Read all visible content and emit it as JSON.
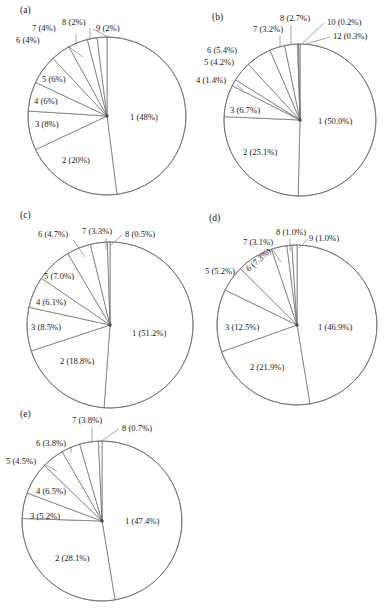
{
  "figure": {
    "width": 384,
    "height": 612,
    "background": "#ffffff",
    "stroke_color": "#6b6b6b",
    "text_color": "#1a1a1a"
  },
  "chart_data": [
    {
      "type": "pie",
      "id": "panel-a",
      "title": "(a)",
      "center": [
        107,
        116
      ],
      "radius": 79,
      "start_angle": -90,
      "direction": "clockwise",
      "grid": false,
      "legend": "none",
      "labels": [
        "1 (48%)",
        "2 (20%)",
        "3 (8%)",
        "4 (6%)",
        "5 (6%)",
        "6 (4%)",
        "7 (4%)",
        "8 (2%)",
        "9 (2%)"
      ],
      "categories": [
        "1",
        "2",
        "3",
        "4",
        "5",
        "6",
        "7",
        "8",
        "9"
      ],
      "values": [
        48,
        20,
        8,
        6,
        6,
        4,
        4,
        2,
        2
      ],
      "label_positions": [
        {
          "label": "1 (48%)",
          "x": 130,
          "y": 120,
          "anchor": "start",
          "leader": null,
          "rotate": 0
        },
        {
          "label": "2 (20%)",
          "x": 62,
          "y": 163,
          "anchor": "start",
          "leader": null,
          "rotate": 0
        },
        {
          "label": "3 (8%)",
          "x": 35,
          "y": 127,
          "anchor": "start",
          "leader": null,
          "rotate": 0
        },
        {
          "label": "4 (6%)",
          "x": 34,
          "y": 104,
          "anchor": "start",
          "leader": null,
          "rotate": 0
        },
        {
          "label": "5 (6%)",
          "x": 42,
          "y": 82,
          "anchor": "start",
          "leader": null,
          "rotate": 0
        },
        {
          "label": "6 (4%)",
          "x": 16,
          "y": 43,
          "anchor": "start",
          "leader": [
            [
              68,
              46
            ],
            [
              83,
              57
            ]
          ],
          "rotate": 0
        },
        {
          "label": "7 (4%)",
          "x": 32,
          "y": 31,
          "anchor": "start",
          "leader": [
            [
              76,
              34
            ],
            [
              76,
              44
            ]
          ],
          "rotate": 0
        },
        {
          "label": "8 (2%)",
          "x": 62,
          "y": 25,
          "anchor": "start",
          "leader": [
            [
              90,
              28
            ],
            [
              90,
              40
            ]
          ],
          "rotate": 0
        },
        {
          "label": "9 (2%)",
          "x": 96,
          "y": 31,
          "anchor": "start",
          "leader": [
            [
              93,
              29
            ],
            [
              110,
              38
            ]
          ],
          "rotate": 0
        }
      ]
    },
    {
      "type": "pie",
      "id": "panel-b",
      "title": "(b)",
      "center": [
        300,
        120
      ],
      "radius": 76,
      "start_angle": -90,
      "direction": "clockwise",
      "grid": false,
      "legend": "none",
      "labels": [
        "1 (50.0%)",
        "2 (25.1%)",
        "3 (6.7%)",
        "4 (1.4%)",
        "5 (4.2%)",
        "6 (5.4%)",
        "7 (3.2%)",
        "8 (2.7%)",
        "10 (0.2%)",
        "12 (0.3%)"
      ],
      "categories": [
        "1",
        "2",
        "3",
        "4",
        "5",
        "6",
        "7",
        "8",
        "10",
        "12"
      ],
      "values": [
        50.0,
        25.1,
        6.7,
        1.4,
        4.2,
        5.4,
        3.2,
        2.7,
        0.2,
        0.3
      ],
      "label_positions": [
        {
          "label": "1 (50.0%)",
          "x": 318,
          "y": 124,
          "anchor": "start",
          "leader": null,
          "rotate": 0
        },
        {
          "label": "2 (25.1%)",
          "x": 243,
          "y": 155,
          "anchor": "start",
          "leader": null,
          "rotate": 0
        },
        {
          "label": "3 (6.7%)",
          "x": 230,
          "y": 113,
          "anchor": "start",
          "leader": null,
          "rotate": 0
        },
        {
          "label": "4 (1.4%)",
          "x": 196,
          "y": 83,
          "anchor": "start",
          "leader": [
            [
              237,
              85
            ],
            [
              243,
              90
            ]
          ],
          "rotate": 0
        },
        {
          "label": "5 (4.2%)",
          "x": 204,
          "y": 65,
          "anchor": "start",
          "leader": null,
          "rotate": 0
        },
        {
          "label": "6 (5.4%)",
          "x": 207,
          "y": 53,
          "anchor": "start",
          "leader": null,
          "rotate": 0
        },
        {
          "label": "7 (3.2%)",
          "x": 253,
          "y": 32,
          "anchor": "start",
          "leader": [
            [
              280,
              36
            ],
            [
              280,
              47
            ]
          ],
          "rotate": 0
        },
        {
          "label": "8 (2.7%)",
          "x": 280,
          "y": 21,
          "anchor": "start",
          "leader": [
            [
              291,
              25
            ],
            [
              291,
              44
            ]
          ],
          "rotate": 0
        },
        {
          "label": "10 (0.2%)",
          "x": 327,
          "y": 25,
          "anchor": "start",
          "leader": [
            [
              324,
              23
            ],
            [
              303,
              43
            ]
          ],
          "rotate": 0
        },
        {
          "label": "12 (0.3%)",
          "x": 333,
          "y": 39,
          "anchor": "start",
          "leader": [
            [
              330,
              37
            ],
            [
              306,
              44
            ]
          ],
          "rotate": 0
        }
      ]
    },
    {
      "type": "pie",
      "id": "panel-c",
      "title": "(c)",
      "center": [
        110,
        325
      ],
      "radius": 83,
      "start_angle": -90,
      "direction": "clockwise",
      "grid": false,
      "legend": "none",
      "labels": [
        "1 (51.2%)",
        "2 (18.8%)",
        "3 (8.5%)",
        "4 (6.1%)",
        "5 (7.0%)",
        "6 (4.7%)",
        "7 (3.3%)",
        "8 (0.5%)"
      ],
      "categories": [
        "1",
        "2",
        "3",
        "4",
        "5",
        "6",
        "7",
        "8"
      ],
      "values": [
        51.2,
        18.8,
        8.5,
        6.1,
        7.0,
        4.7,
        3.3,
        0.5
      ],
      "label_positions": [
        {
          "label": "1 (51.2%)",
          "x": 132,
          "y": 336,
          "anchor": "start",
          "leader": null,
          "rotate": 0
        },
        {
          "label": "2 (18.8%)",
          "x": 60,
          "y": 364,
          "anchor": "start",
          "leader": null,
          "rotate": 0
        },
        {
          "label": "3 (8.5%)",
          "x": 31,
          "y": 330,
          "anchor": "start",
          "leader": null,
          "rotate": 0
        },
        {
          "label": "4 (6.1%)",
          "x": 36,
          "y": 305,
          "anchor": "start",
          "leader": null,
          "rotate": 0
        },
        {
          "label": "5 (7.0%)",
          "x": 44,
          "y": 279,
          "anchor": "start",
          "leader": null,
          "rotate": 0
        },
        {
          "label": "6 (4.7%)",
          "x": 38,
          "y": 237,
          "anchor": "start",
          "leader": [
            [
              73,
              240
            ],
            [
              85,
              257
            ]
          ],
          "rotate": 0
        },
        {
          "label": "7 (3.3%)",
          "x": 82,
          "y": 234,
          "anchor": "start",
          "leader": [
            [
              106,
              238
            ],
            [
              106,
              250
            ]
          ],
          "rotate": 0
        },
        {
          "label": "8 (0.5%)",
          "x": 125,
          "y": 237,
          "anchor": "start",
          "leader": [
            [
              122,
              235
            ],
            [
              111,
              245
            ]
          ],
          "rotate": 0
        }
      ]
    },
    {
      "type": "pie",
      "id": "panel-d",
      "title": "(d)",
      "center": [
        297,
        325
      ],
      "radius": 80,
      "start_angle": -90,
      "direction": "clockwise",
      "grid": false,
      "legend": "none",
      "labels": [
        "1 (46.9%)",
        "2 (21.9%)",
        "3 (12.5%)",
        "5 (5.2%)",
        "6 (7.3%)",
        "7 (3.1%)",
        "8 (1.0%)",
        "9 (1.0%)"
      ],
      "categories": [
        "1",
        "2",
        "3",
        "5",
        "6",
        "7",
        "8",
        "9"
      ],
      "values": [
        46.9,
        21.9,
        12.5,
        5.2,
        7.3,
        3.1,
        1.0,
        1.0
      ],
      "label_positions": [
        {
          "label": "1 (46.9%)",
          "x": 318,
          "y": 330,
          "anchor": "start",
          "leader": null,
          "rotate": 0
        },
        {
          "label": "2 (21.9%)",
          "x": 250,
          "y": 370,
          "anchor": "start",
          "leader": null,
          "rotate": 0
        },
        {
          "label": "3 (12.5%)",
          "x": 225,
          "y": 330,
          "anchor": "start",
          "leader": null,
          "rotate": 0
        },
        {
          "label": "5 (5.2%)",
          "x": 205,
          "y": 274,
          "anchor": "start",
          "leader": null,
          "rotate": 0
        },
        {
          "label": "6 (7.3%)",
          "x": 249,
          "y": 272,
          "anchor": "start",
          "leader": null,
          "rotate": -42
        },
        {
          "label": "7 (3.1%)",
          "x": 243,
          "y": 245,
          "anchor": "start",
          "leader": [
            [
              272,
              249
            ],
            [
              281,
              262
            ]
          ],
          "rotate": 0
        },
        {
          "label": "8 (1.0%)",
          "x": 276,
          "y": 235,
          "anchor": "start",
          "leader": [
            [
              290,
              239
            ],
            [
              290,
              251
            ]
          ],
          "rotate": 0
        },
        {
          "label": "9 (1.0%)",
          "x": 309,
          "y": 241,
          "anchor": "start",
          "leader": [
            [
              308,
              239
            ],
            [
              299,
              248
            ]
          ],
          "rotate": 0
        }
      ]
    },
    {
      "type": "pie",
      "id": "panel-e",
      "title": "(e)",
      "center": [
        102,
        521
      ],
      "radius": 80,
      "start_angle": -90,
      "direction": "clockwise",
      "grid": false,
      "legend": "none",
      "labels": [
        "1 (47.4%)",
        "2 (28.1%)",
        "3 (5.2%)",
        "4 (6.5%)",
        "5 (4.5%)",
        "6 (3.8%)",
        "7 (3.8%)",
        "8 (0.7%)"
      ],
      "categories": [
        "1",
        "2",
        "3",
        "4",
        "5",
        "6",
        "7",
        "8"
      ],
      "values": [
        47.4,
        28.1,
        5.2,
        6.5,
        4.5,
        3.8,
        3.8,
        0.7
      ],
      "label_positions": [
        {
          "label": "1 (47.4%)",
          "x": 125,
          "y": 524,
          "anchor": "start",
          "leader": null,
          "rotate": 0
        },
        {
          "label": "2 (28.1%)",
          "x": 55,
          "y": 561,
          "anchor": "start",
          "leader": null,
          "rotate": 0
        },
        {
          "label": "3 (5.2%)",
          "x": 30,
          "y": 519,
          "anchor": "start",
          "leader": null,
          "rotate": 0
        },
        {
          "label": "4 (6.5%)",
          "x": 36,
          "y": 494,
          "anchor": "start",
          "leader": null,
          "rotate": 0
        },
        {
          "label": "5 (4.5%)",
          "x": 6,
          "y": 464,
          "anchor": "start",
          "leader": [
            [
              44,
              464
            ],
            [
              57,
              471
            ]
          ],
          "rotate": 0
        },
        {
          "label": "6 (3.8%)",
          "x": 36,
          "y": 446,
          "anchor": "start",
          "leader": [
            [
              71,
              447
            ],
            [
              71,
              453
            ]
          ],
          "rotate": 0
        },
        {
          "label": "7 (3.8%)",
          "x": 72,
          "y": 423,
          "anchor": "start",
          "leader": [
            [
              92,
              427
            ],
            [
              92,
              442
            ]
          ],
          "rotate": 0
        },
        {
          "label": "8 (0.7%)",
          "x": 122,
          "y": 431,
          "anchor": "start",
          "leader": [
            [
              119,
              429
            ],
            [
              103,
              440
            ]
          ],
          "rotate": 0
        }
      ]
    }
  ]
}
